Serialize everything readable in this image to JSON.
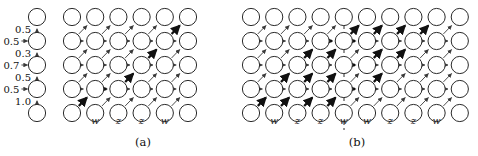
{
  "figure": {
    "width": 478,
    "height": 156,
    "background": "#ffffff"
  },
  "colors": {
    "stroke": "#2b2b2b",
    "edge": "#3a3a3a",
    "bold_edge": "#111111",
    "node_white": "#ffffff",
    "shade_black": "#1a1a1a",
    "shade_dark": "#4d4d4d",
    "shade_mid": "#777777",
    "shade_light": "#a8a8a8",
    "shade_gray": "#9a9a9a"
  },
  "panels": [
    {
      "id": "a",
      "caption": "(a)",
      "caption_x": 143,
      "caption_y": 146,
      "origin_x": 72,
      "origin_y": 17,
      "dx": 23.2,
      "dy": 24.0,
      "cols": 6,
      "rows": 5,
      "radius": 8.6,
      "column_labels": [
        {
          "text": "w",
          "col": 1
        },
        {
          "text": "z",
          "col": 2
        },
        {
          "text": "z",
          "col": 3
        },
        {
          "text": "w",
          "col": 4
        }
      ],
      "label_y": 124,
      "shaded_nodes": [
        {
          "col": 0,
          "row": 4,
          "shade": "shade_gray"
        },
        {
          "col": 5,
          "row": 0,
          "shade": "shade_gray"
        }
      ],
      "bold_path": [
        {
          "col": 0,
          "row": 4
        },
        {
          "col": 1,
          "row": 3
        },
        {
          "col": 2,
          "row": 3
        },
        {
          "col": 3,
          "row": 2
        },
        {
          "col": 4,
          "row": 1
        },
        {
          "col": 5,
          "row": 0
        }
      ],
      "divider": null
    },
    {
      "id": "b",
      "caption": "(b)",
      "caption_x": 357,
      "caption_y": 146,
      "origin_x": 251,
      "origin_y": 17,
      "dx": 23.2,
      "dy": 24.0,
      "cols": 10,
      "rows": 5,
      "radius": 8.6,
      "column_labels": [
        {
          "text": "w",
          "col": 1
        },
        {
          "text": "z",
          "col": 2
        },
        {
          "text": "z",
          "col": 3
        },
        {
          "text": "w",
          "col": 4
        },
        {
          "text": "w",
          "col": 5
        },
        {
          "text": "z",
          "col": 6
        },
        {
          "text": "z",
          "col": 7
        },
        {
          "text": "w",
          "col": 8
        }
      ],
      "label_y": 124,
      "shaded_nodes": [
        {
          "col": 0,
          "row": 4,
          "shade": "shade_black"
        },
        {
          "col": 1,
          "row": 4,
          "shade": "shade_dark"
        },
        {
          "col": 2,
          "row": 4,
          "shade": "shade_mid"
        },
        {
          "col": 3,
          "row": 4,
          "shade": "shade_light"
        },
        {
          "col": 5,
          "row": 0,
          "shade": "shade_black"
        },
        {
          "col": 6,
          "row": 0,
          "shade": "shade_dark"
        },
        {
          "col": 7,
          "row": 0,
          "shade": "shade_mid"
        },
        {
          "col": 8,
          "row": 0,
          "shade": "shade_light"
        }
      ],
      "bold_paths": [
        [
          {
            "col": 0,
            "row": 4
          },
          {
            "col": 1,
            "row": 3
          },
          {
            "col": 2,
            "row": 2
          },
          {
            "col": 3,
            "row": 1
          },
          {
            "col": 4,
            "row": 1
          },
          {
            "col": 5,
            "row": 0
          }
        ],
        [
          {
            "col": 1,
            "row": 4
          },
          {
            "col": 2,
            "row": 3
          },
          {
            "col": 3,
            "row": 2
          },
          {
            "col": 4,
            "row": 1
          },
          {
            "col": 5,
            "row": 1
          },
          {
            "col": 6,
            "row": 0
          }
        ],
        [
          {
            "col": 2,
            "row": 4
          },
          {
            "col": 3,
            "row": 3
          },
          {
            "col": 4,
            "row": 2
          },
          {
            "col": 5,
            "row": 2
          },
          {
            "col": 6,
            "row": 1
          },
          {
            "col": 7,
            "row": 0
          }
        ],
        [
          {
            "col": 3,
            "row": 4
          },
          {
            "col": 4,
            "row": 3
          },
          {
            "col": 5,
            "row": 3
          },
          {
            "col": 6,
            "row": 2
          },
          {
            "col": 7,
            "row": 1
          },
          {
            "col": 8,
            "row": 0
          }
        ]
      ],
      "divider": {
        "x": 344,
        "y1": 8,
        "y2": 130
      }
    }
  ],
  "chain": {
    "x": 37,
    "origin_y": 17,
    "dy": 24.0,
    "radius": 8.6,
    "nodes": [
      {
        "index": 0,
        "shade": "node_white"
      },
      {
        "index": 1,
        "shade": "shade_gray"
      },
      {
        "index": 2,
        "shade": "shade_gray"
      },
      {
        "index": 3,
        "shade": "shade_gray"
      },
      {
        "index": 4,
        "shade": "node_white"
      }
    ],
    "vertical_labels": [
      {
        "text": "0.5",
        "y": 29
      },
      {
        "text": "0.3",
        "y": 53
      },
      {
        "text": "0.5",
        "y": 77
      },
      {
        "text": "1.0",
        "y": 101
      }
    ],
    "side_labels": [
      {
        "text": "0.5",
        "y": 41
      },
      {
        "text": "0.7",
        "y": 65
      },
      {
        "text": "0.5",
        "y": 89
      }
    ]
  }
}
